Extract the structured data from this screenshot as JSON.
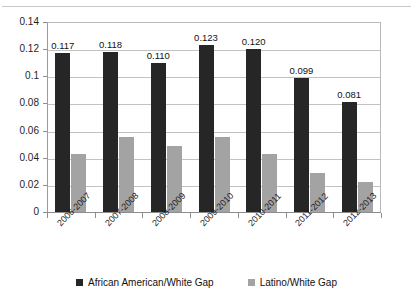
{
  "chart_data": {
    "type": "bar",
    "title": "",
    "xlabel": "",
    "ylabel": "",
    "ylim": [
      0,
      0.14
    ],
    "yticks": [
      "0",
      "0.02",
      "0.04",
      "0.06",
      "0.08",
      "0.1",
      "0.12",
      "0.14"
    ],
    "ytick_values": [
      0,
      0.02,
      0.04,
      0.06,
      0.08,
      0.1,
      0.12,
      0.14
    ],
    "grid": true,
    "legend_position": "bottom",
    "categories": [
      "2006-2007",
      "2007-2008",
      "2008-2009",
      "2009-2010",
      "2010-2011",
      "2011-2012",
      "2012-2013"
    ],
    "series": [
      {
        "name": "African American/White Gap",
        "color": "#262626",
        "values": [
          0.117,
          0.118,
          0.11,
          0.123,
          0.12,
          0.099,
          0.081
        ],
        "labels": [
          "0.117",
          "0.118",
          "0.110",
          "0.123",
          "0.120",
          "0.099",
          "0.081"
        ],
        "labels_shown": true
      },
      {
        "name": "Latino/White Gap",
        "color": "#a3a3a3",
        "values": [
          0.043,
          0.055,
          0.049,
          0.055,
          0.043,
          0.029,
          0.022
        ],
        "labels": [
          "",
          "",
          "",
          "",
          "",
          "",
          ""
        ],
        "labels_shown": false
      }
    ]
  },
  "legend": {
    "items": [
      {
        "label": "African American/White Gap",
        "color": "#262626"
      },
      {
        "label": "Latino/White Gap",
        "color": "#a3a3a3"
      }
    ]
  }
}
